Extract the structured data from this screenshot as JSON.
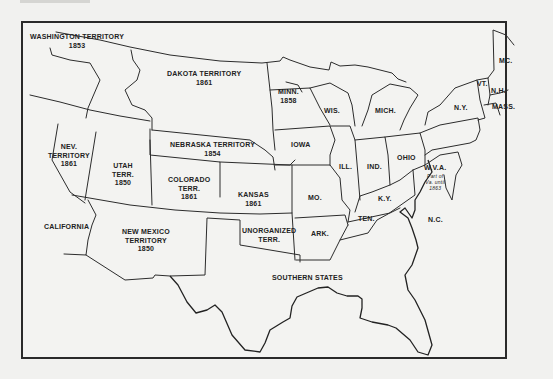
{
  "map": {
    "title": "",
    "regions": [
      {
        "id": "washington",
        "name": "WASHINGTON TERRITORY",
        "year": "1853"
      },
      {
        "id": "dakota",
        "name": "DAKOTA TERRITORY",
        "year": "1861"
      },
      {
        "id": "nebraska",
        "name": "NEBRASKA TERRITORY",
        "year": "1854"
      },
      {
        "id": "nevada",
        "name": "NEV.",
        "name2": "TERRITORY",
        "year": "1861"
      },
      {
        "id": "utah",
        "name": "UTAH",
        "name2": "TERR.",
        "year": "1850"
      },
      {
        "id": "colorado",
        "name": "COLORADO",
        "name2": "TERR.",
        "year": "1861"
      },
      {
        "id": "kansas",
        "name": "KANSAS",
        "year": "1861"
      },
      {
        "id": "california",
        "name": "CALIFORNIA"
      },
      {
        "id": "new_mexico",
        "name": "NEW MEXICO",
        "name2": "TERRITORY",
        "year": "1850"
      },
      {
        "id": "unorganized",
        "name": "UNORGANIZED",
        "name2": "TERR."
      },
      {
        "id": "southern",
        "name": "SOUTHERN STATES"
      },
      {
        "id": "minnesota",
        "name": "MINN.",
        "year": "1858"
      },
      {
        "id": "wisconsin",
        "name": "WIS."
      },
      {
        "id": "michigan",
        "name": "MICH."
      },
      {
        "id": "iowa",
        "name": "IOWA"
      },
      {
        "id": "illinois",
        "name": "ILL."
      },
      {
        "id": "indiana",
        "name": "IND."
      },
      {
        "id": "ohio",
        "name": "OHIO"
      },
      {
        "id": "missouri",
        "name": "MO."
      },
      {
        "id": "kentucky",
        "name": "K.Y."
      },
      {
        "id": "tennessee",
        "name": "TEN."
      },
      {
        "id": "arkansas",
        "name": "ARK."
      },
      {
        "id": "west_virginia",
        "name": "W.V.A.",
        "note": [
          "Part of",
          "Va. until",
          "1863"
        ]
      },
      {
        "id": "north_carolina",
        "name": "N.C."
      },
      {
        "id": "new_york",
        "name": "N.Y."
      },
      {
        "id": "vermont",
        "name": "VT."
      },
      {
        "id": "new_hampshire",
        "name": "N.H."
      },
      {
        "id": "maine",
        "name": "MC."
      },
      {
        "id": "massachusetts",
        "name": "MASS."
      }
    ]
  },
  "colors": {
    "background": "#f1f1ef",
    "line": "#2c2c2c",
    "text": "#222222"
  }
}
